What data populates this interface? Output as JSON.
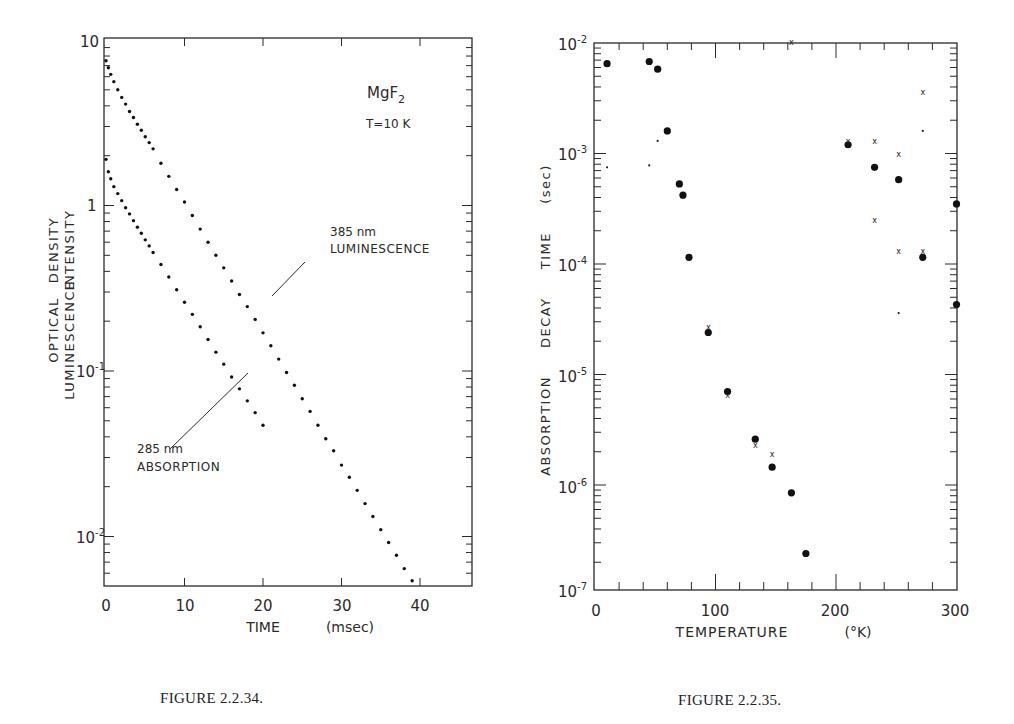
{
  "figures": [
    {
      "caption": "FIGURE 2.2.34.",
      "annotation_material": "MgF",
      "annotation_material_sub": "2",
      "annotation_temp": "T=10  K",
      "ylabel_line1": "OPTICAL",
      "ylabel_line1b": "DENSITY",
      "ylabel_line2": "LUMINESCENCE",
      "ylabel_line2b": "INTENSITY",
      "xlabel": "TIME",
      "xlabel_unit": "(msec)",
      "series_labels": [
        {
          "line1": "385  nm",
          "line2": "LUMINESCENCE"
        },
        {
          "line1": "285  nm",
          "line2": "ABSORPTION"
        }
      ]
    },
    {
      "caption": "FIGURE 2.2.35.",
      "ylabel": "ABSORPTION     DECAY     TIME     (sec)",
      "xlabel": "TEMPERATURE",
      "xlabel_unit": "(°K)"
    }
  ],
  "chart_data": [
    {
      "type": "scatter",
      "title": "MgF2, T=10 K",
      "xlabel": "TIME (msec)",
      "ylabel": "OPTICAL DENSITY / LUMINESCENCE INTENSITY",
      "xscale": "linear",
      "yscale": "log",
      "xlim": [
        0,
        46
      ],
      "ylim": [
        0.005,
        10
      ],
      "xticks": [
        "0",
        "10",
        "20",
        "30",
        "40"
      ],
      "yticks": [
        "10",
        "1",
        "10^-1",
        "10^-2"
      ],
      "grid": false,
      "series": [
        {
          "name": "385 nm LUMINESCENCE",
          "x": [
            0,
            0.3,
            0.6,
            1.0,
            1.5,
            2.0,
            2.5,
            3.0,
            3.5,
            4.0,
            4.5,
            5.0,
            5.5,
            6.0,
            7.0,
            8.0,
            9.0,
            10.0,
            11.0,
            12.0,
            13.0,
            14.0,
            15.0,
            16.0,
            17.0,
            18.0,
            19.0,
            20.0,
            21.0,
            22.0,
            23.0,
            24.0,
            25.0,
            26.0,
            27.0,
            28.0,
            29.0,
            30.0,
            31.0,
            32.0,
            33.0,
            34.0,
            35.0,
            36.0,
            37.0,
            38.0,
            39.0,
            40.0,
            41.0,
            42.0,
            43.0,
            44.0
          ],
          "y": [
            7.5,
            6.8,
            6.2,
            5.6,
            5.0,
            4.5,
            4.1,
            3.7,
            3.4,
            3.1,
            2.85,
            2.6,
            2.4,
            2.2,
            1.8,
            1.5,
            1.25,
            1.05,
            0.87,
            0.72,
            0.6,
            0.5,
            0.42,
            0.35,
            0.29,
            0.245,
            0.205,
            0.17,
            0.142,
            0.118,
            0.098,
            0.082,
            0.068,
            0.057,
            0.047,
            0.039,
            0.033,
            0.027,
            0.0228,
            0.019,
            0.0158,
            0.0132,
            0.011,
            0.0092,
            0.0077,
            0.0064,
            0.0054,
            0.0045,
            0.0038,
            0.0032,
            0.0027,
            0.0023
          ]
        },
        {
          "name": "285 nm ABSORPTION",
          "x": [
            0,
            0.3,
            0.6,
            1.0,
            1.5,
            2.0,
            2.5,
            3.0,
            3.5,
            4.0,
            4.5,
            5.0,
            5.5,
            6.0,
            7.0,
            8.0,
            9.0,
            10.0,
            11.0,
            12.0,
            13.0,
            14.0,
            15.0,
            16.0,
            17.0,
            18.0,
            19.0,
            20.0
          ],
          "y": [
            1.9,
            1.6,
            1.45,
            1.3,
            1.18,
            1.07,
            0.97,
            0.89,
            0.81,
            0.74,
            0.68,
            0.62,
            0.57,
            0.52,
            0.44,
            0.37,
            0.31,
            0.26,
            0.22,
            0.185,
            0.155,
            0.13,
            0.11,
            0.092,
            0.078,
            0.066,
            0.056,
            0.047
          ]
        }
      ]
    },
    {
      "type": "scatter",
      "title": "",
      "xlabel": "TEMPERATURE (°K)",
      "ylabel": "ABSORPTION DECAY TIME (sec)",
      "xscale": "linear",
      "yscale": "log",
      "xlim": [
        0,
        300
      ],
      "ylim": [
        1e-07,
        0.01
      ],
      "xticks": [
        "0",
        "100",
        "200",
        "300"
      ],
      "yticks": [
        "10^-2",
        "10^-3",
        "10^-4",
        "10^-5",
        "10^-6",
        "10^-7"
      ],
      "grid": false,
      "series": [
        {
          "name": "large dots",
          "marker": "circle-large",
          "x": [
            10,
            45,
            52,
            60,
            70,
            73,
            78,
            94,
            110,
            133,
            147,
            163,
            175,
            210,
            232,
            252,
            272,
            300,
            300
          ],
          "y": [
            0.0065,
            0.0068,
            0.0058,
            0.0016,
            0.00053,
            0.00042,
            0.000115,
            2.4e-05,
            7e-06,
            2.6e-06,
            1.45e-06,
            8.5e-07,
            2.4e-07,
            0.0012,
            0.00075,
            0.00058,
            0.000115,
            0.00035,
            4.3e-05
          ]
        },
        {
          "name": "crosses",
          "marker": "x",
          "x": [
            94,
            110,
            133,
            147,
            163,
            210,
            232,
            232,
            252,
            252,
            272,
            272
          ],
          "y": [
            2.7e-05,
            6.5e-06,
            2.3e-06,
            1.9e-06,
            0.0102,
            0.0013,
            0.0013,
            0.00025,
            0.001,
            0.00013,
            0.0036,
            0.00013
          ]
        },
        {
          "name": "small dots",
          "marker": "circle-small",
          "x": [
            10,
            45,
            52,
            252,
            272
          ],
          "y": [
            0.00075,
            0.00078,
            0.0013,
            3.6e-05,
            0.0016
          ]
        }
      ]
    }
  ]
}
